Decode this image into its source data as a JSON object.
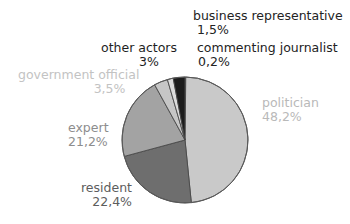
{
  "chart_data": {
    "type": "pie",
    "title": "",
    "subtitle": "",
    "xlabel": "",
    "ylabel": "",
    "legend_position": "none",
    "grid": false,
    "total": 100,
    "value_suffix": "%",
    "decimal_separator": ",",
    "categories": [
      "commenting journalist",
      "politician",
      "resident",
      "expert",
      "government official",
      "business representative",
      "other actors"
    ],
    "values": [
      0.2,
      48.2,
      22.4,
      21.2,
      3.5,
      1.5,
      3.0
    ],
    "slices": [
      {
        "label": "commenting journalist",
        "value": 0.2,
        "value_text": "0,2%",
        "color": "#3a3a3a",
        "label_color": "#232323"
      },
      {
        "label": "politician",
        "value": 48.2,
        "value_text": "48,2%",
        "color": "#c9c9c9",
        "label_color": "#b9b9b9"
      },
      {
        "label": "resident",
        "value": 22.4,
        "value_text": "22,4%",
        "color": "#6e6e6e",
        "label_color": "#5d5d5d"
      },
      {
        "label": "expert",
        "value": 21.2,
        "value_text": "21,2%",
        "color": "#a3a3a3",
        "label_color": "#8d8d8d"
      },
      {
        "label": "government official",
        "value": 3.5,
        "value_text": "3,5%",
        "color": "#c6c6c6",
        "label_color": "#c3c3c3"
      },
      {
        "label": "business representative",
        "value": 1.5,
        "value_text": "1,5%",
        "color": "#dcdcdc",
        "label_color": "#232323"
      },
      {
        "label": "other actors",
        "value": 3.0,
        "value_text": "3%",
        "color": "#1c1c1c",
        "label_color": "#1e1e1e"
      }
    ],
    "geometry": {
      "center_x": 185,
      "center_y": 140,
      "radius": 63,
      "start_angle_deg": 0,
      "direction": "clockwise"
    },
    "background_color": "#ffffff"
  }
}
